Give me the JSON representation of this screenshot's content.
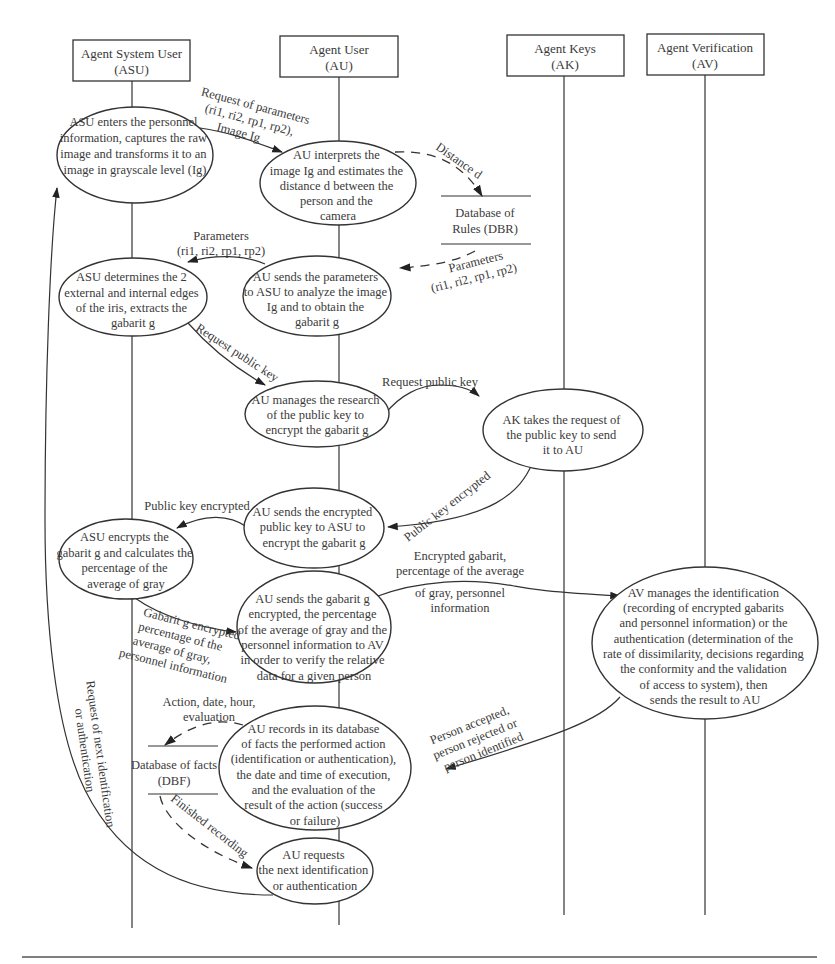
{
  "agents": [
    {
      "name": "Agent System User",
      "abbr": "(ASU)"
    },
    {
      "name": "Agent User",
      "abbr": "(AU)"
    },
    {
      "name": "Agent Keys",
      "abbr": "(AK)"
    },
    {
      "name": "Agent Verification",
      "abbr": "(AV)"
    }
  ],
  "nodes": {
    "asu_enter": [
      "ASU enters the personnel",
      "information, captures the raw",
      "image and transforms it to an",
      "image in grayscale level (Ig)"
    ],
    "au_interpret": [
      "AU interprets the",
      "image Ig and estimates the",
      "distance d between the",
      "person and the",
      "camera"
    ],
    "asu_edges": [
      "ASU determines the 2",
      "external and internal edges",
      "of the iris, extracts the",
      "gabarit g"
    ],
    "au_sends_params": [
      "AU sends the parameters",
      "to ASU to analyze the image",
      "Ig and to obtain the",
      "gabarit g"
    ],
    "au_manages_key": [
      "AU manages the research",
      "of the public key to",
      "encrypt the gabarit g"
    ],
    "ak_takes": [
      "AK takes the request of",
      "the public key to send",
      "it to AU"
    ],
    "au_sends_key": [
      "AU sends the encrypted",
      "public key to ASU to",
      "encrypt the gabarit g"
    ],
    "asu_encrypts": [
      "ASU encrypts the",
      "gabarit g and calculates the",
      "percentage of the",
      "average of gray"
    ],
    "au_sends_gabarit": [
      "AU sends the gabarit g",
      "encrypted, the percentage",
      "of the average of gray and the",
      "personnel information to AV",
      "in order to verify the relative",
      "data for a given person"
    ],
    "av_manages": [
      "AV manages the identification",
      "(recording of encrypted gabarits",
      "and personnel information) or the",
      "authentication (determination of the",
      "rate of dissimilarity, decisions regarding",
      "the conformity and the validation",
      "of access to system), then",
      "sends the result to AU"
    ],
    "au_records": [
      "AU records in its database",
      "of facts the performed action",
      "(identification or authentication),",
      "the date and time of execution,",
      "and the evaluation of the",
      "result of the action (success",
      "or failure)"
    ],
    "au_requests_next": [
      "AU requests",
      "the next identification",
      "or authentication"
    ]
  },
  "stores": {
    "dbr": [
      "Database of",
      "Rules (DBR)"
    ],
    "dbf": [
      "Database of facts",
      "(DBF)"
    ]
  },
  "messages": {
    "req_params": [
      "Request of parameters",
      "(ri1, ri2, rp1, rp2),",
      "Image Ig"
    ],
    "distance": "Distance d",
    "params_from_dbr": [
      "Parameters",
      "(ri1, ri2, rp1, rp2)"
    ],
    "params_to_asu": [
      "Parameters",
      "(ri1, ri2, rp1, rp2)"
    ],
    "req_pub_key_1": "Request public key",
    "req_pub_key_2": "Request public key",
    "pub_key_enc_1": "Public key encrypted",
    "pub_key_enc_2": "Public key encrypted",
    "enc_gabarit_av": [
      "Encrypted gabarit,",
      "percentage of the average",
      "of gray, personnel",
      "information"
    ],
    "gabarit_enc_au": [
      "Gabarit g encrypted",
      "percentage of the",
      "average of gray,",
      "personnel information"
    ],
    "action_date": [
      "Action, date, hour,",
      "evaluation"
    ],
    "person_result": [
      "Person accepted,",
      "person rejected or",
      "person identified"
    ],
    "finished": "Finished recording",
    "req_next": [
      "Request of next identification",
      "or authentication"
    ]
  }
}
